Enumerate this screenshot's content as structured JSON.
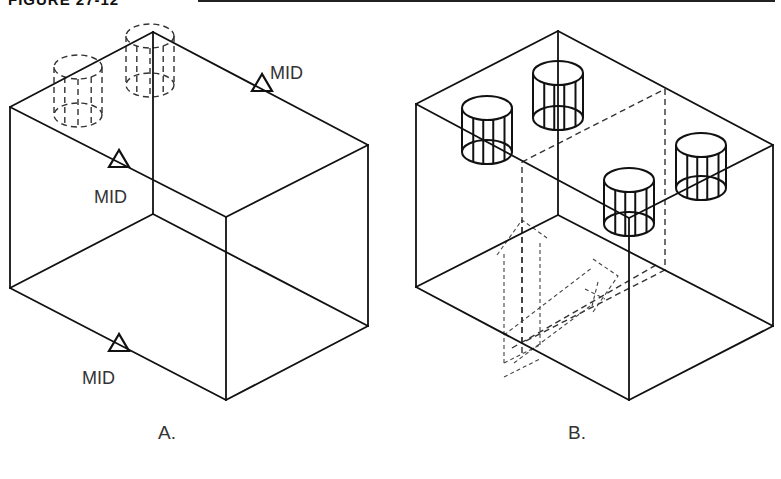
{
  "figure": {
    "title": "FIGURE 27-12",
    "colors": {
      "line": "#111111",
      "hidden_line": "#333333",
      "text": "#333333",
      "background": "#ffffff"
    }
  },
  "panels": [
    {
      "id": "A",
      "caption": "A.",
      "caption_pos": [
        158,
        439
      ],
      "box": {
        "top_back": [
          153,
          32
        ],
        "top_left": [
          10,
          107
        ],
        "top_right": [
          368,
          145
        ],
        "top_front": [
          226,
          217
        ],
        "bot_back": [
          153,
          214
        ],
        "bot_left": [
          10,
          288
        ],
        "bot_right": [
          368,
          326
        ],
        "bot_front": [
          226,
          400
        ]
      },
      "markers": [
        {
          "name": "mid-marker-top-right-edge",
          "label": "MID",
          "tri": [
            262,
            84
          ],
          "text": [
            270,
            79
          ]
        },
        {
          "name": "mid-marker-top-left-edge",
          "label": "MID",
          "tri": [
            119,
            160
          ],
          "text": [
            94,
            203
          ]
        },
        {
          "name": "mid-marker-bottom-left-edge",
          "label": "MID",
          "tri": [
            119,
            344
          ],
          "text": [
            82,
            384
          ]
        }
      ],
      "hidden_cylinders": [
        {
          "cx": 78,
          "top_y": 67,
          "bot_y": 115,
          "rx": 24,
          "ry": 12
        },
        {
          "cx": 150,
          "top_y": 36,
          "bot_y": 85,
          "rx": 24,
          "ry": 12
        }
      ]
    },
    {
      "id": "B",
      "caption": "B.",
      "caption_pos": [
        568,
        439
      ],
      "box": {
        "top_back": [
          558,
          31
        ],
        "top_left": [
          416,
          104
        ],
        "top_right": [
          773,
          145
        ],
        "top_front": [
          629,
          218
        ],
        "bot_back": [
          558,
          215
        ],
        "bot_left": [
          416,
          287
        ],
        "bot_right": [
          773,
          326
        ],
        "bot_front": [
          629,
          400
        ]
      },
      "cylinders": [
        {
          "name": "cylinder-back-left",
          "cx": 487,
          "top_y": 108,
          "bot_y": 152,
          "rx": 25,
          "ry": 12
        },
        {
          "name": "cylinder-back",
          "cx": 558,
          "top_y": 73,
          "bot_y": 118,
          "rx": 25,
          "ry": 12
        },
        {
          "name": "cylinder-front",
          "cx": 629,
          "top_y": 180,
          "bot_y": 224,
          "rx": 25,
          "ry": 12
        },
        {
          "name": "cylinder-right",
          "cx": 701,
          "top_y": 145,
          "bot_y": 188,
          "rx": 25,
          "ry": 12
        }
      ],
      "hidden_plane": {
        "points": [
          [
            522,
            162
          ],
          [
            665,
            89
          ],
          [
            665,
            270
          ],
          [
            522,
            343
          ]
        ]
      },
      "ucs_icon": {
        "origin": [
          522,
          343
        ],
        "y_axis_top": [
          522,
          220
        ],
        "x_axis_end": [
          618,
          294
        ]
      }
    }
  ]
}
